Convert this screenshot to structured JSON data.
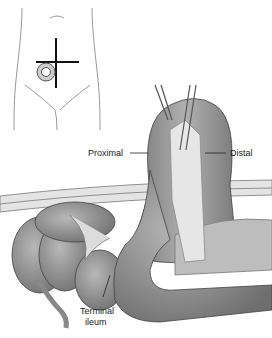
{
  "figure": {
    "type": "surgical illustration",
    "inset": {
      "description": "abdomen outline with crosshair incision marker and stoma in right lower quadrant"
    },
    "labels": {
      "proximal": "Proximal",
      "distal": "Distal",
      "terminal_ileum_line1": "Terminal",
      "terminal_ileum_line2": "ileum"
    },
    "colors": {
      "bowel": "#8a8a8a",
      "bowel_light": "#b5b5b5",
      "line": "#333333",
      "mesentery": "#d8d8d8"
    }
  }
}
